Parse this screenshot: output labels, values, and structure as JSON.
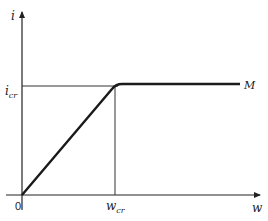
{
  "diagram": {
    "y_axis_label": "i",
    "x_axis_label": "w",
    "origin_label": "0",
    "y_level_label_main": "i",
    "y_level_label_sub": "cr",
    "x_level_label_main": "w",
    "x_level_label_sub": "cr",
    "curve_label": "M",
    "colors": {
      "line": "#1a1a1a",
      "axis": "#222222",
      "guide": "#333333"
    }
  }
}
